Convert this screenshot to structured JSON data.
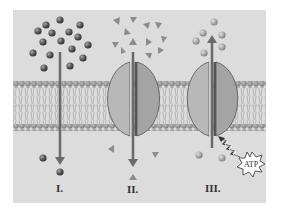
{
  "figure": {
    "panels": [
      {
        "id": "I",
        "label": "I.",
        "particle_shape": "sphere",
        "particle_tone": "dark",
        "arrow_direction": "down",
        "has_protein": false,
        "energy": ""
      },
      {
        "id": "II",
        "label": "II.",
        "particle_shape": "triangle",
        "particle_tone": "medium",
        "arrow_direction": "down",
        "has_protein": true,
        "energy": ""
      },
      {
        "id": "III",
        "label": "III.",
        "particle_shape": "sphere",
        "particle_tone": "light",
        "arrow_direction": "up",
        "has_protein": true,
        "energy": "ATP"
      }
    ],
    "atp_label": "ATP"
  },
  "colors": {
    "background": "#dcdcdc",
    "membrane_head": "#9a9a9a",
    "arrow": "#6a6a6a",
    "protein": "#b8b8b8",
    "dark_particle": "#555555",
    "light_particle": "#a8a8a8",
    "triangle": "#8c8c8c"
  }
}
